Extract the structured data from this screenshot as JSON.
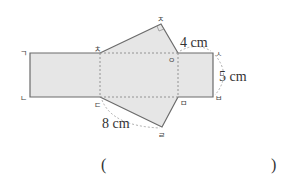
{
  "figure": {
    "vertices": {
      "g": "ㄱ",
      "n": "ㄴ",
      "d": "ㄷ",
      "r": "ㄹ",
      "m": "ㅁ",
      "b": "ㅂ",
      "s": "ㅅ",
      "o": "ㅇ",
      "j": "ㅈ",
      "ch": "ㅊ"
    },
    "measurements": {
      "top_segment": "4 cm",
      "right_side": "5 cm",
      "bottom_slant": "8 cm"
    },
    "right_angle_at": "ㅈ"
  },
  "answer": {
    "open_paren": "(",
    "close_paren": ")",
    "value": ""
  }
}
